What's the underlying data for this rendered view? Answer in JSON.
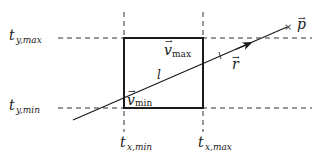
{
  "diagram": {
    "colors": {
      "ink": "#1a1a1a",
      "dash": "#333333",
      "background": "#ffffff"
    },
    "box": {
      "x_min": 124,
      "y_min": 38,
      "x_max": 203,
      "y_max": 108,
      "corner_min_label": {
        "base": "v",
        "sub": "min",
        "vector": true
      },
      "corner_max_label": {
        "base": "v",
        "sub": "max",
        "vector": true
      }
    },
    "slab_lines": {
      "horizontal": [
        {
          "y": 38,
          "label": {
            "base": "t",
            "sub": "y,max"
          }
        },
        {
          "y": 108,
          "label": {
            "base": "t",
            "sub": "y,min"
          }
        }
      ],
      "vertical": [
        {
          "x": 124,
          "label": {
            "base": "t",
            "sub": "x,min"
          }
        },
        {
          "x": 203,
          "label": {
            "base": "t",
            "sub": "x,max"
          }
        }
      ]
    },
    "ray": {
      "start": [
        73,
        120
      ],
      "end": [
        289,
        26
      ],
      "segment_label": "l",
      "direction_label": {
        "base": "r",
        "vector": true
      },
      "point_label": {
        "base": "p",
        "vector": true
      },
      "point_marker": "×"
    }
  },
  "labels": {
    "t_y_max_base": "t",
    "t_y_max_sub": "y,max",
    "t_y_min_base": "t",
    "t_y_min_sub": "y,min",
    "t_x_min_base": "t",
    "t_x_min_sub": "x,min",
    "t_x_max_base": "t",
    "t_x_max_sub": "x,max",
    "v_max_base": "v",
    "v_max_sub": "max",
    "v_min_base": "v",
    "v_min_sub": "min",
    "l": "l",
    "r": "r",
    "p": "p",
    "vec_arrow": "→",
    "x_marker": "×"
  }
}
